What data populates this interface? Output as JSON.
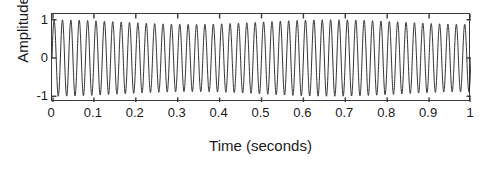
{
  "chart_data": {
    "type": "line",
    "title": "",
    "xlabel": "Time (seconds)",
    "ylabel": "Amplitude",
    "xlim": [
      0,
      1
    ],
    "ylim": [
      -1.15,
      1.15
    ],
    "xticks": [
      0,
      0.1,
      0.2,
      0.3,
      0.4,
      0.5,
      0.6,
      0.7,
      0.8,
      0.9,
      1
    ],
    "xtick_labels": [
      "0",
      "0.1",
      "0.2",
      "0.3",
      "0.4",
      "0.5",
      "0.6",
      "0.7",
      "0.8",
      "0.9",
      "1"
    ],
    "yticks": [
      -1,
      0,
      1
    ],
    "ytick_labels": [
      "-1",
      "0",
      "1"
    ],
    "grid": false,
    "legend": null,
    "tick_direction": "in",
    "box": true,
    "line_color": "#1a1a1a",
    "line_width": 0.9,
    "background_color": "#ffffff",
    "series": [
      {
        "name": "signal",
        "description": "Dense sinusoidal oscillation, approximately 50 Hz, amplitude 1, spanning 0 to 1 second, with a slight beat/envelope pinch giving narrow sharp peaks and troughs.",
        "frequency_hz": 50,
        "amplitude": 1,
        "beat_frequency_hz": 1.5,
        "beat_depth": 0.12,
        "samples_per_second": 4000,
        "duration_seconds": 1
      }
    ]
  },
  "axes": {
    "ylabel": "Amplitude",
    "xlabel": "Time (seconds)"
  }
}
